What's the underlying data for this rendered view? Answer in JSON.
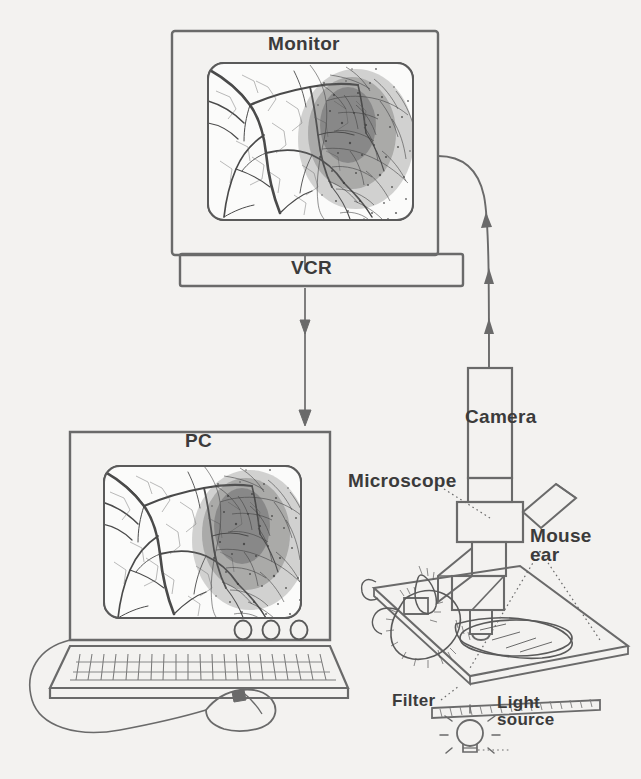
{
  "figure": {
    "background_color": "#f3f2f0",
    "ink_color": "#4a4a4a",
    "label_color": "#3b3b3b"
  },
  "labels": {
    "monitor": "Monitor",
    "vcr": "VCR",
    "pc": "PC",
    "camera": "Camera",
    "microscope": "Microscope",
    "mouse_ear": "Mouse\near",
    "filter": "Filter",
    "light_source": "Light\nsource"
  },
  "components": [
    {
      "name": "monitor",
      "label": "Monitor",
      "shape": "rounded-rectangle-display"
    },
    {
      "name": "vcr",
      "label": "VCR",
      "shape": "horizontal-bar"
    },
    {
      "name": "pc",
      "label": "PC",
      "shape": "laptop-with-keyboard"
    },
    {
      "name": "camera",
      "label": "Camera",
      "shape": "vertical-box"
    },
    {
      "name": "microscope",
      "label": "Microscope",
      "shape": "upright-microscope"
    },
    {
      "name": "mouse_ear",
      "label": "Mouse ear",
      "shape": "spread-ear-on-dish"
    },
    {
      "name": "filter",
      "label": "Filter",
      "shape": "hatched-strip"
    },
    {
      "name": "light_source",
      "label": "Light source",
      "shape": "bulb-with-rays"
    }
  ],
  "signal_flow": [
    {
      "from": "light_source",
      "to": "mouse_ear",
      "style": "illumination"
    },
    {
      "from": "microscope",
      "to": "camera",
      "style": "optical"
    },
    {
      "from": "camera",
      "to": "monitor",
      "style": "curved-cable-arrows"
    },
    {
      "from": "monitor",
      "to": "vcr",
      "style": "short-connector"
    },
    {
      "from": "vcr",
      "to": "pc",
      "style": "vertical-arrow"
    }
  ],
  "screen_content": {
    "description": "Mouse ear microvasculature: branching vessel tree at left, dense dark angiogenic tumor region at right",
    "shown_on": [
      "monitor",
      "pc"
    ]
  }
}
